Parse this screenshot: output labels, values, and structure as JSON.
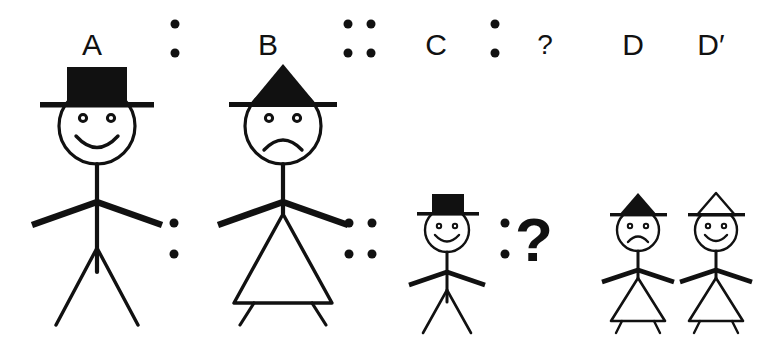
{
  "puzzle": {
    "type": "visual-analogy",
    "statement": "A : B :: C : ?",
    "answer_options_label": "D D'",
    "labels": {
      "a": "A",
      "b": "B",
      "c": "C",
      "question": "?",
      "d": "D",
      "d_prime": "D′"
    },
    "question_mark_large": "?",
    "colors": {
      "ink": "#111111",
      "background": "#ffffff",
      "hat_fill_black": "#111111",
      "hat_fill_white": "#ffffff"
    },
    "operators": [
      {
        "name": "ratio-colon-top",
        "kind": "colon",
        "dots": 2
      },
      {
        "name": "proportion-top",
        "kind": "double-colon",
        "dots": 4
      },
      {
        "name": "ratio-colon-top-2",
        "kind": "colon",
        "dots": 2
      },
      {
        "name": "ratio-colon-bottom",
        "kind": "colon",
        "dots": 2
      },
      {
        "name": "proportion-bottom",
        "kind": "double-colon",
        "dots": 4
      },
      {
        "name": "ratio-colon-bottom-2",
        "kind": "colon",
        "dots": 2
      }
    ],
    "figures": [
      {
        "id": "figure-a",
        "label": "A",
        "size": "large",
        "hat": "top-hat",
        "hat_fill": "black",
        "face": "smile",
        "body": "legs",
        "role": "term-1"
      },
      {
        "id": "figure-b",
        "label": "B",
        "size": "large",
        "hat": "pointed-hat",
        "hat_fill": "black",
        "face": "frown",
        "body": "skirt",
        "role": "term-2"
      },
      {
        "id": "figure-c",
        "label": "C",
        "size": "small",
        "hat": "top-hat",
        "hat_fill": "black",
        "face": "smile",
        "body": "legs",
        "role": "term-3"
      },
      {
        "id": "figure-d",
        "label": "D",
        "size": "small",
        "hat": "pointed-hat",
        "hat_fill": "black",
        "face": "frown",
        "body": "skirt",
        "role": "answer-option"
      },
      {
        "id": "figure-d-prime",
        "label": "D′",
        "size": "small",
        "hat": "pointed-hat",
        "hat_fill": "white",
        "face": "smile",
        "body": "skirt",
        "role": "answer-option"
      }
    ]
  }
}
